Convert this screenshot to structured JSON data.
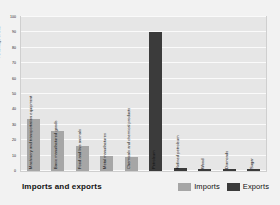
{
  "caption": "Imports and exports",
  "legend": {
    "items": [
      {
        "label": "Imports",
        "color": "#a6a6a6",
        "key": "imports"
      },
      {
        "label": "Exports",
        "color": "#3b3b3b",
        "key": "exports"
      }
    ]
  },
  "chart_data": {
    "type": "bar",
    "title": "Imports and exports",
    "xlabel": "",
    "ylabel": "Percentage of total",
    "ylim": [
      0,
      100
    ],
    "ytick_step": 10,
    "yticks": [
      "0",
      "10",
      "20",
      "30",
      "40",
      "50",
      "60",
      "70",
      "80",
      "90",
      "100"
    ],
    "grid": true,
    "legend_position": "bottom-right",
    "categories": [
      "Machinery and transportation equipment",
      "Basic manufactured goods",
      "Food and live animals",
      "Metal manufactures",
      "Chemicals and chemical products",
      "Petroleum",
      "Refined petroleum",
      "Wood",
      "Diamonds",
      "Sugar"
    ],
    "series": [
      {
        "name": "Imports",
        "color": "#a6a6a6",
        "values": [
          34,
          26,
          16,
          10,
          9,
          null,
          null,
          null,
          null,
          null
        ]
      },
      {
        "name": "Exports",
        "color": "#3b3b3b",
        "values": [
          null,
          null,
          null,
          null,
          null,
          90,
          2,
          1,
          1,
          1
        ]
      }
    ],
    "bars": [
      {
        "label": "Machinery and transportation equipment",
        "value": 34,
        "series": "imports"
      },
      {
        "label": "Basic manufactured goods",
        "value": 26,
        "series": "imports"
      },
      {
        "label": "Food and live animals",
        "value": 16,
        "series": "imports"
      },
      {
        "label": "Metal manufactures",
        "value": 10,
        "series": "imports"
      },
      {
        "label": "Chemicals and chemical products",
        "value": 9,
        "series": "imports"
      },
      {
        "label": "Petroleum",
        "value": 90,
        "series": "exports"
      },
      {
        "label": "Refined petroleum",
        "value": 2,
        "series": "exports"
      },
      {
        "label": "Wood",
        "value": 1,
        "series": "exports"
      },
      {
        "label": "Diamonds",
        "value": 1,
        "series": "exports"
      },
      {
        "label": "Sugar",
        "value": 1,
        "series": "exports"
      }
    ]
  }
}
